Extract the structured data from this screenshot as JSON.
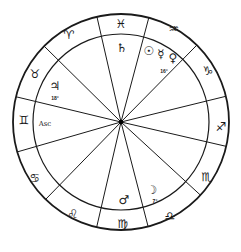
{
  "chart": {
    "center": [
      121,
      122
    ],
    "outer_radius": 108,
    "inner_radius": 88,
    "colors": {
      "line": "#1a1a1a",
      "background": "#ffffff"
    }
  },
  "signs": [
    {
      "name": "pisces",
      "glyph": "♓",
      "x": 121,
      "y": 24
    },
    {
      "name": "aquarius",
      "glyph": "♒",
      "x": 174,
      "y": 29
    },
    {
      "name": "capricorn",
      "glyph": "♑",
      "x": 208,
      "y": 71
    },
    {
      "name": "sagittarius",
      "glyph": "♐",
      "x": 221,
      "y": 127
    },
    {
      "name": "scorpio",
      "glyph": "♏",
      "x": 207,
      "y": 177
    },
    {
      "name": "libra",
      "glyph": "♎",
      "x": 170,
      "y": 216
    },
    {
      "name": "virgo",
      "glyph": "♍",
      "x": 123,
      "y": 224
    },
    {
      "name": "leo",
      "glyph": "♌",
      "x": 73,
      "y": 214
    },
    {
      "name": "cancer",
      "glyph": "♋",
      "x": 35,
      "y": 178
    },
    {
      "name": "gemini",
      "glyph": "♊",
      "x": 24,
      "y": 120
    },
    {
      "name": "taurus",
      "glyph": "♉",
      "x": 35,
      "y": 74
    },
    {
      "name": "aries",
      "glyph": "♈",
      "x": 69,
      "y": 35
    }
  ],
  "planets": [
    {
      "name": "saturn",
      "glyph": "♄",
      "x": 122,
      "y": 48
    },
    {
      "name": "sun",
      "glyph": "☉",
      "x": 149,
      "y": 51
    },
    {
      "name": "mercury",
      "glyph": "☿",
      "x": 161,
      "y": 54
    },
    {
      "name": "venus",
      "glyph": "♀",
      "x": 173,
      "y": 58
    },
    {
      "name": "jupiter",
      "glyph": "♃",
      "x": 55,
      "y": 86
    },
    {
      "name": "mars",
      "glyph": "♂",
      "x": 124,
      "y": 200
    },
    {
      "name": "moon",
      "glyph": "☽",
      "x": 152,
      "y": 190
    }
  ],
  "degrees": [
    {
      "label": "16°",
      "x": 164,
      "y": 71
    },
    {
      "label": "18°",
      "x": 55,
      "y": 98
    },
    {
      "label": "7°",
      "x": 155,
      "y": 201
    }
  ],
  "ascendant": {
    "label": "Asc",
    "x": 45,
    "y": 124
  },
  "house_cusps": [
    [
      97,
      17
    ],
    [
      149,
      17
    ],
    [
      195,
      47
    ],
    [
      223,
      97
    ],
    [
      229,
      147
    ],
    [
      209,
      203
    ],
    [
      149,
      230
    ],
    [
      96,
      230
    ],
    [
      46,
      199
    ],
    [
      17,
      152
    ],
    [
      17,
      97
    ],
    [
      45,
      47
    ]
  ]
}
